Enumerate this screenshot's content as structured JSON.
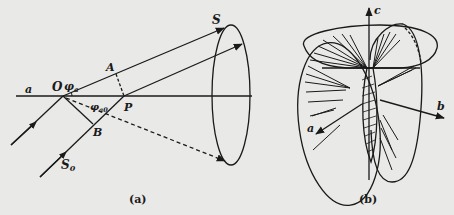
{
  "panels": [
    {
      "caption": "(a)",
      "labels": {
        "axis": "a",
        "origin": "O",
        "angle_top": "φa",
        "angle_top_base": "φ",
        "angle_top_sub": "a",
        "angle_bottom": "φa0",
        "angle_bottom_base": "φ",
        "angle_bottom_sub": "a0",
        "point_A": "A",
        "point_B": "B",
        "point_P": "P",
        "scattered": "S",
        "incident": "S0",
        "incident_base": "S",
        "incident_sub": "0"
      }
    },
    {
      "caption": "(b)",
      "labels": {
        "axis_a": "a",
        "axis_b": "b",
        "axis_c": "c"
      }
    }
  ],
  "colors": {
    "background": "#e9e9e7",
    "ink": "#1a1a1a"
  }
}
